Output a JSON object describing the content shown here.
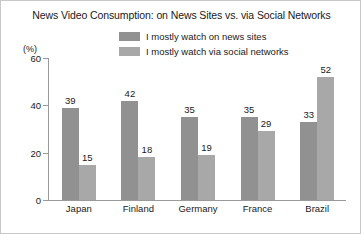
{
  "chart_data": {
    "type": "bar",
    "title": "News Video Consumption: on News Sites vs. via Social Networks",
    "xlabel": "",
    "ylabel": "(%)",
    "ylim": [
      0,
      60
    ],
    "yticks": [
      0,
      20,
      40,
      60
    ],
    "grid": false,
    "legend_position": "top-center",
    "categories": [
      "Japan",
      "Finland",
      "Germany",
      "France",
      "Brazil"
    ],
    "series": [
      {
        "name": "I mostly watch on news sites",
        "color": "#919191",
        "values": [
          39,
          42,
          35,
          35,
          33
        ]
      },
      {
        "name": "I mostly watch via social networks",
        "color": "#a8a8a8",
        "values": [
          15,
          18,
          19,
          29,
          52
        ]
      }
    ]
  },
  "axis": {
    "unit_label": "(%)",
    "tick_labels": [
      "60",
      "40",
      "20",
      "0"
    ]
  },
  "legend": {
    "items": [
      {
        "label": "I mostly watch on news sites",
        "color": "#919191"
      },
      {
        "label": "I mostly watch via social networks",
        "color": "#a8a8a8"
      }
    ]
  }
}
